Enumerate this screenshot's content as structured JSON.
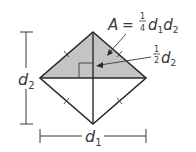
{
  "diagram": {
    "type": "rhombus-area",
    "colors": {
      "shaded": "#c4c4c4",
      "stroke": "#2a2a2a",
      "text": "#3a3a3a",
      "background": "#ffffff"
    },
    "labels": {
      "area_formula": {
        "var_A": "A",
        "equals": "=",
        "frac_num": "1",
        "frac_den": "4",
        "d1_var": "d",
        "d1_sub": "1",
        "d2_var": "d",
        "d2_sub": "2"
      },
      "half_d2": {
        "frac_num": "1",
        "frac_den": "2",
        "var": "d",
        "sub": "2"
      },
      "d2_dimension": {
        "var": "d",
        "sub": "2"
      },
      "d1_dimension": {
        "var": "d",
        "sub": "1"
      }
    }
  }
}
